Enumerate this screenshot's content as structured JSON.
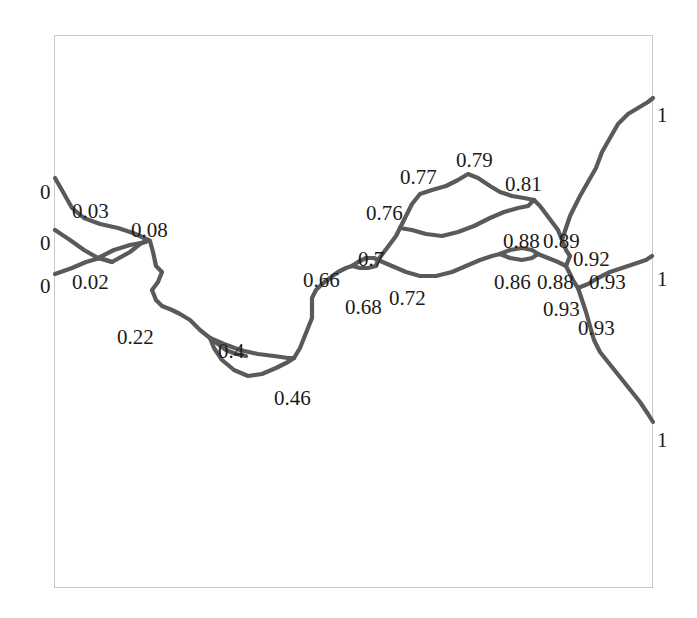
{
  "figure": {
    "title": "",
    "background_color": "#ffffff",
    "frame": {
      "color": "#c9c9c9",
      "x": 54,
      "y": 35,
      "width": 599,
      "height": 553,
      "border_width": 1
    },
    "line_color": "#5a5a5a",
    "label_color": "#1b1b1b",
    "value_range": [
      0,
      1
    ]
  },
  "chart_data": {
    "type": "line",
    "title": "",
    "xlabel": "",
    "ylabel": "",
    "grid": false,
    "legend": "none",
    "nodes": [
      {
        "label": "0",
        "value": 0,
        "x": 40,
        "y": 182,
        "anchor": "left-boundary"
      },
      {
        "label": "0",
        "value": 0,
        "x": 40,
        "y": 233,
        "anchor": "left-boundary"
      },
      {
        "label": "0",
        "value": 0,
        "x": 40,
        "y": 276,
        "anchor": "left-boundary"
      },
      {
        "label": "0.03",
        "value": 0.03,
        "x": 72,
        "y": 201
      },
      {
        "label": "0.02",
        "value": 0.02,
        "x": 72,
        "y": 272
      },
      {
        "label": "0.08",
        "value": 0.08,
        "x": 131,
        "y": 220
      },
      {
        "label": "0.22",
        "value": 0.22,
        "x": 117,
        "y": 327
      },
      {
        "label": "0.4",
        "value": 0.4,
        "x": 218,
        "y": 341
      },
      {
        "label": "0.46",
        "value": 0.46,
        "x": 274,
        "y": 388
      },
      {
        "label": "0.66",
        "value": 0.66,
        "x": 303,
        "y": 270
      },
      {
        "label": "0.68",
        "value": 0.68,
        "x": 345,
        "y": 297
      },
      {
        "label": "0.7",
        "value": 0.7,
        "x": 358,
        "y": 249
      },
      {
        "label": "0.72",
        "value": 0.72,
        "x": 389,
        "y": 288
      },
      {
        "label": "0.76",
        "value": 0.76,
        "x": 366,
        "y": 203
      },
      {
        "label": "0.77",
        "value": 0.77,
        "x": 400,
        "y": 167
      },
      {
        "label": "0.79",
        "value": 0.79,
        "x": 456,
        "y": 150
      },
      {
        "label": "0.81",
        "value": 0.81,
        "x": 505,
        "y": 174
      },
      {
        "label": "0.88",
        "value": 0.88,
        "x": 503,
        "y": 231
      },
      {
        "label": "0.89",
        "value": 0.89,
        "x": 543,
        "y": 231
      },
      {
        "label": "0.92",
        "value": 0.92,
        "x": 573,
        "y": 249
      },
      {
        "label": "0.86",
        "value": 0.86,
        "x": 494,
        "y": 272
      },
      {
        "label": "0.88",
        "value": 0.88,
        "x": 537,
        "y": 272
      },
      {
        "label": "0.93",
        "value": 0.93,
        "x": 589,
        "y": 272
      },
      {
        "label": "0.93",
        "value": 0.93,
        "x": 543,
        "y": 299
      },
      {
        "label": "0.93",
        "value": 0.93,
        "x": 578,
        "y": 318
      },
      {
        "label": "1",
        "value": 1,
        "x": 657,
        "y": 105,
        "anchor": "right-boundary"
      },
      {
        "label": "1",
        "value": 1,
        "x": 657,
        "y": 269,
        "anchor": "right-boundary"
      },
      {
        "label": "1",
        "value": 1,
        "x": 657,
        "y": 430,
        "anchor": "right-boundary"
      }
    ],
    "paths": [
      {
        "name": "branch-0-upper",
        "points": "55,178 63,192 72,208 84,218 100,224 118,228 133,233"
      },
      {
        "name": "branch-0-middle",
        "points": "55,230 70,240 84,250 98,258 112,262 130,252 140,244 148,240"
      },
      {
        "name": "branch-0-lower",
        "points": "55,274 72,268 86,262 100,258 112,262"
      },
      {
        "name": "lens-0.08-upper",
        "points": "98,258 114,250 130,245 146,242 148,240"
      },
      {
        "name": "junction-to-0.08",
        "points": "133,233 140,236 148,240 150,241"
      },
      {
        "name": "descent-to-0.22",
        "points": "150,241 153,252 156,266 162,272 158,282 152,290 156,300 162,306 172,310 180,314 190,320 200,330 210,338 218,344 226,350 236,354 246,356"
      },
      {
        "name": "lens-0.46-lower",
        "points": "210,338 214,348 222,360 234,370 248,376 262,374 276,368 288,362 294,358"
      },
      {
        "name": "lens-0.46-upper",
        "points": "210,338 224,344 240,350 258,354 274,356 288,358 294,358"
      },
      {
        "name": "rise-to-0.66",
        "points": "294,358 300,348 304,338 308,328 312,318 312,308 312,298 316,290 322,284 330,278 338,272 346,268 352,266"
      },
      {
        "name": "loop-0.7-upper",
        "points": "352,266 358,262 366,258 374,258 378,260"
      },
      {
        "name": "loop-0.7-lower",
        "points": "352,266 360,268 368,268 376,266 378,260"
      },
      {
        "name": "up-to-0.76",
        "points": "378,260 384,252 390,244 396,236 400,228"
      },
      {
        "name": "loop-top-0.77-0.79",
        "points": "400,228 406,216 412,204 420,194 432,190 446,186 458,180 468,174 478,178 490,186 500,192 512,196 524,198 534,200"
      },
      {
        "name": "loop-mid-0.79-right",
        "points": "400,228 412,230 426,234 442,236 458,232 474,226 490,218 504,212 518,208 528,206 534,200"
      },
      {
        "name": "right-from-0.81",
        "points": "534,200 540,206 546,214 552,222 558,230 562,240 566,250 570,256"
      },
      {
        "name": "lower-0.72-to-0.86",
        "points": "378,260 392,266 406,272 420,276 436,276 452,272 466,266 480,260 492,256 500,254"
      },
      {
        "name": "lens-0.88-upper",
        "points": "500,254 510,250 522,248 532,250 538,254"
      },
      {
        "name": "lens-0.88-lower",
        "points": "500,254 510,258 522,260 532,258 538,254"
      },
      {
        "name": "to-central-junction",
        "points": "538,254 548,258 558,262 566,266 570,256"
      },
      {
        "name": "junction-down",
        "points": "566,266 570,274 574,282 578,288"
      },
      {
        "name": "branch-to-right-1",
        "points": "578,288 588,284 598,278 610,272 622,268 634,264 646,260 652,256"
      },
      {
        "name": "branch-up-to-top-1",
        "points": "562,240 566,228 570,216 574,208 580,196 588,182 596,168 602,152 610,138 618,124 628,114 638,108 648,102 653,98"
      },
      {
        "name": "branch-down-to-bottom-1",
        "points": "578,288 582,300 586,312 590,326 594,340 600,352 608,362 616,372 624,382 632,392 640,402 648,414 653,422"
      }
    ]
  }
}
